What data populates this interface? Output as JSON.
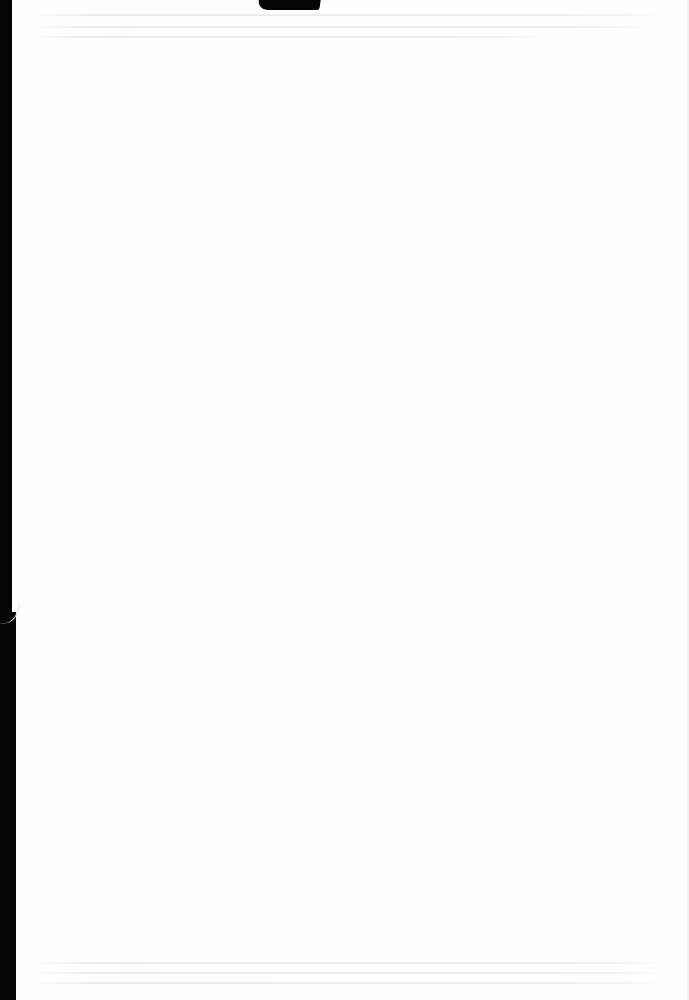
{
  "document": {
    "type": "scanned-page",
    "content": "",
    "page_state": "blank"
  },
  "colors": {
    "paper": "#fefefe",
    "scan_edge": "#050505",
    "bleed_through": "#e8e8e8"
  }
}
